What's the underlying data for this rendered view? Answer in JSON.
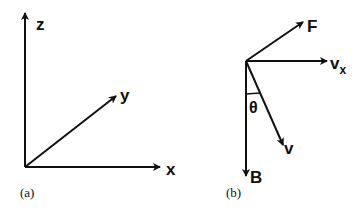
{
  "colors": {
    "stroke": "#111111",
    "background": "#ffffff"
  },
  "panel_a": {
    "caption": "(a)",
    "axes": {
      "z_label": "z",
      "y_label": "y",
      "x_label": "x"
    }
  },
  "panel_b": {
    "caption": "(b)",
    "vectors": {
      "F_label": "F",
      "vx_label": "v",
      "vx_subscript": "x",
      "v_label": "v",
      "B_label": "B"
    },
    "angle_label": "θ"
  }
}
